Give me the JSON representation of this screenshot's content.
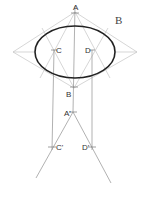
{
  "figure": {
    "panel_label": "B",
    "points": {
      "A": "A",
      "B": "B",
      "C": "C",
      "D": "D",
      "A_prime": "A'",
      "C_prime": "C'",
      "D_prime": "D'"
    },
    "colors": {
      "ellipse": "#222222",
      "construction": "#b8b8b8",
      "projection": "#8a8a8a"
    }
  }
}
